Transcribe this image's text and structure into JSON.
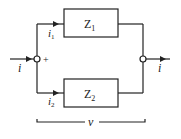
{
  "diagram": {
    "type": "parallel-impedance-circuit",
    "impedances": [
      {
        "label": "Z",
        "subscript": "1",
        "branch": "top"
      },
      {
        "label": "Z",
        "subscript": "2",
        "branch": "bottom"
      }
    ],
    "currents": {
      "input": "i",
      "output": "i",
      "branch1": {
        "label": "i",
        "subscript": "1"
      },
      "branch2": {
        "label": "i",
        "subscript": "2"
      }
    },
    "voltage": {
      "label": "v",
      "polarity": "+"
    },
    "colors": {
      "line": "#222222",
      "background": "#ffffff"
    }
  }
}
